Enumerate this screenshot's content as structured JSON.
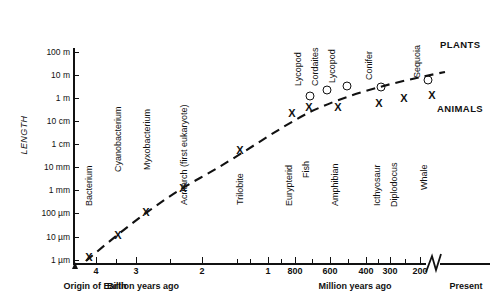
{
  "chart_data": {
    "type": "scatter",
    "title": "",
    "ylabel": "LENGTH",
    "xlabel_left": "Billion years ago",
    "xlabel_right": "Million years ago",
    "origin_label": "Origin of Earth",
    "present_label": "Present",
    "y_tick_labels": [
      "100 m",
      "10 m",
      "1 m",
      "10 cm",
      "1 cm",
      "10 mm",
      "1 mm",
      "100 µm",
      "10 µm",
      "1 µm"
    ],
    "x_tick_labels_billions": [
      "4",
      "3",
      "2",
      "1"
    ],
    "x_tick_labels_millions": [
      "800",
      "600",
      "400",
      "300",
      "200"
    ],
    "legend": [
      "PLANTS",
      "ANIMALS"
    ],
    "marker_animal": "X",
    "marker_plant": "O",
    "axis_break": true,
    "grid": false,
    "points": [
      {
        "name": "Bacterium",
        "marker": "X",
        "group": "ANIMALS",
        "x_label": "3.5 billion years ago",
        "y_label": "1 µm"
      },
      {
        "name": "Cyanobacterium",
        "marker": "X",
        "group": "ANIMALS",
        "x_label": "3.0 billion years ago",
        "y_label": "10 µm"
      },
      {
        "name": "Myxobacterium",
        "marker": "X",
        "group": "ANIMALS",
        "x_label": "2.2 billion years ago",
        "y_label": "100 µm"
      },
      {
        "name": "Acritarch (first eukaryote)",
        "marker": "X",
        "group": "ANIMALS",
        "x_label": "1.4 billion years ago",
        "y_label": "1 mm"
      },
      {
        "name": "Trilobite",
        "marker": "X",
        "group": "ANIMALS",
        "x_label": "600 million years ago",
        "y_label": "10 cm"
      },
      {
        "name": "Eurypterid",
        "marker": "X",
        "group": "ANIMALS",
        "x_label": "420 million years ago",
        "y_label": "1 m"
      },
      {
        "name": "Fish",
        "marker": "X",
        "group": "ANIMALS",
        "x_label": "380 million years ago",
        "y_label": "1 m"
      },
      {
        "name": "Lycopod",
        "marker": "O",
        "group": "PLANTS",
        "x_label": "380 million years ago",
        "y_label": "1 m"
      },
      {
        "name": "Cordaites",
        "marker": "O",
        "group": "PLANTS",
        "x_label": "330 million years ago",
        "y_label": "3 m"
      },
      {
        "name": "Amphibian",
        "marker": "X",
        "group": "ANIMALS",
        "x_label": "310 million years ago",
        "y_label": "1 m"
      },
      {
        "name": "Lycopod",
        "marker": "O",
        "group": "PLANTS",
        "x_label": "290 million years ago",
        "y_label": "6 m"
      },
      {
        "name": "Icthyosaur",
        "marker": "X",
        "group": "ANIMALS",
        "x_label": "210 million years ago",
        "y_label": "3 m"
      },
      {
        "name": "Conifer",
        "marker": "O",
        "group": "PLANTS",
        "x_label": "200 million years ago",
        "y_label": "10 m"
      },
      {
        "name": "Diplodocus",
        "marker": "X",
        "group": "ANIMALS",
        "x_label": "150 million years ago",
        "y_label": "6 m"
      },
      {
        "name": "Sequoia",
        "marker": "O",
        "group": "PLANTS",
        "x_label": "present",
        "y_label": "30 m"
      },
      {
        "name": "Whale",
        "marker": "X",
        "group": "ANIMALS",
        "x_label": "present",
        "y_label": "10 m"
      }
    ],
    "trend_line": "dashed increasing curve from lower-left to upper-right"
  },
  "geometry": {
    "y_ticks": [
      {
        "label": "100 m",
        "y": 52
      },
      {
        "label": "10 m",
        "y": 75
      },
      {
        "label": "1 m",
        "y": 98
      },
      {
        "label": "10 cm",
        "y": 121
      },
      {
        "label": "1 cm",
        "y": 144
      },
      {
        "label": "10 mm",
        "y": 167
      },
      {
        "label": "1 mm",
        "y": 190
      },
      {
        "label": "100 µm",
        "y": 213
      },
      {
        "label": "10 µm",
        "y": 237
      },
      {
        "label": "1 µm",
        "y": 260
      }
    ],
    "x_ticks": [
      {
        "label": "4",
        "x": 96,
        "major": true
      },
      {
        "label": "",
        "x": 116,
        "major": false
      },
      {
        "label": "3",
        "x": 136,
        "major": true
      },
      {
        "label": "",
        "x": 170,
        "major": false
      },
      {
        "label": "2",
        "x": 202,
        "major": true
      },
      {
        "label": "",
        "x": 237,
        "major": false
      },
      {
        "label": "",
        "x": 250,
        "major": false
      },
      {
        "label": "1",
        "x": 268,
        "major": true
      },
      {
        "label": "",
        "x": 281,
        "major": false
      },
      {
        "label": "800",
        "x": 295,
        "major": true
      },
      {
        "label": "",
        "x": 312,
        "major": false
      },
      {
        "label": "600",
        "x": 330,
        "major": true
      },
      {
        "label": "",
        "x": 348,
        "major": false
      },
      {
        "label": "400",
        "x": 366,
        "major": true
      },
      {
        "label": "",
        "x": 378,
        "major": false
      },
      {
        "label": "300",
        "x": 390,
        "major": true
      },
      {
        "label": "",
        "x": 405,
        "major": false
      },
      {
        "label": "200",
        "x": 420,
        "major": true
      }
    ],
    "markers": [
      {
        "kind": "x",
        "cx": 89,
        "cy": 257
      },
      {
        "kind": "x",
        "cx": 118,
        "cy": 235
      },
      {
        "kind": "x",
        "cx": 146,
        "cy": 212
      },
      {
        "kind": "x",
        "cx": 183,
        "cy": 188
      },
      {
        "kind": "x",
        "cx": 240,
        "cy": 150
      },
      {
        "kind": "x",
        "cx": 292,
        "cy": 113
      },
      {
        "kind": "x",
        "cx": 309,
        "cy": 107
      },
      {
        "kind": "o",
        "cx": 310,
        "cy": 96
      },
      {
        "kind": "o",
        "cx": 327,
        "cy": 90
      },
      {
        "kind": "x",
        "cx": 338,
        "cy": 107
      },
      {
        "kind": "o",
        "cx": 347,
        "cy": 86
      },
      {
        "kind": "x",
        "cx": 379,
        "cy": 103
      },
      {
        "kind": "o",
        "cx": 381,
        "cy": 87
      },
      {
        "kind": "x",
        "cx": 404,
        "cy": 98
      },
      {
        "kind": "o",
        "cx": 428,
        "cy": 80
      },
      {
        "kind": "x",
        "cx": 432,
        "cy": 95
      }
    ],
    "point_labels": [
      {
        "text": "Bacterium",
        "x": 94,
        "y": 196
      },
      {
        "text": "Cyanobacterium",
        "x": 123,
        "y": 162
      },
      {
        "text": "Myxobacterium",
        "x": 152,
        "y": 160
      },
      {
        "text": "Acritarch (first eukaryote)",
        "x": 189,
        "y": 195
      },
      {
        "text": "Trilobite",
        "x": 245,
        "y": 195
      },
      {
        "text": "Eurypterid",
        "x": 294,
        "y": 196
      },
      {
        "text": "Fish",
        "x": 311,
        "y": 168
      },
      {
        "text": "Amphibian",
        "x": 340,
        "y": 196
      },
      {
        "text": "Icthyosaur",
        "x": 382,
        "y": 196
      },
      {
        "text": "Diplodocus",
        "x": 399,
        "y": 197
      },
      {
        "text": "Whale",
        "x": 429,
        "y": 180
      },
      {
        "text": "Lycopod",
        "x": 303,
        "y": 76
      },
      {
        "text": "Cordaites",
        "x": 320,
        "y": 76
      },
      {
        "text": "Lycopod",
        "x": 337,
        "y": 73
      },
      {
        "text": "Conifer",
        "x": 374,
        "y": 70
      },
      {
        "text": "Sequoia",
        "x": 422,
        "y": 68
      }
    ],
    "group_labels": [
      {
        "text": "PLANTS",
        "x": 440,
        "y": 39
      },
      {
        "text": "ANIMALS",
        "x": 437,
        "y": 103
      }
    ]
  }
}
